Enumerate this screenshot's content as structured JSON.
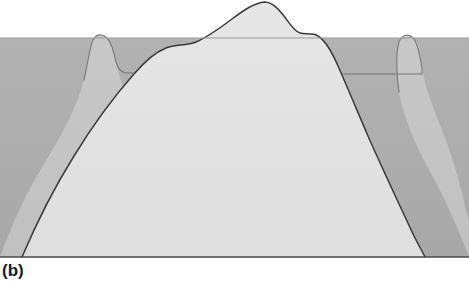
{
  "figure": {
    "panel_label": "(b)",
    "caption_text": "",
    "title": "",
    "kind": "geologic-block-cross-section"
  },
  "colors": {
    "background": "#ffffff",
    "block_base": "#adadad",
    "intermediate_layer": "#c4c4c4",
    "core_mountain": "#e3e3e3",
    "outline": "#3a3a3a",
    "soft_edge": "#8e8e8e",
    "label_text": "#1c1c1c"
  },
  "geometry": {
    "canvas": {
      "width": 469,
      "height": 283
    },
    "block": {
      "left": 0,
      "top": 38,
      "right": 469,
      "bottom": 257
    },
    "summit": {
      "x": 265,
      "y": 2
    },
    "left_bump_apex": {
      "x": 98,
      "y": 35
    },
    "right_bump_apex": {
      "x": 408,
      "y": 36
    }
  },
  "layers": [
    {
      "name": "block-base",
      "role": "surrounding-rock-mass",
      "fill": "#adadad",
      "path": "M 0 38 L 469 38 L 469 257 L 0 257 Z"
    },
    {
      "name": "intermediate-layer-left",
      "role": "eroded-flank-left",
      "fill": "#c4c4c4",
      "path": "M 0 257 C 10 230 24 196 44 164 C 62 134 76 110 84 80 C 88 62 90 46 93 40 C 96 34 102 33 107 38 C 112 43 114 52 116 62 C 119 76 124 92 134 112 C 146 136 160 164 172 190 C 182 212 190 236 196 257 Z"
    },
    {
      "name": "intermediate-layer-right",
      "role": "eroded-flank-right",
      "fill": "#c4c4c4",
      "path": "M 469 257 C 458 228 444 196 428 168 C 414 142 404 118 399 92 C 396 72 396 52 399 42 C 402 34 409 33 414 39 C 418 45 420 56 422 68 C 425 86 432 106 442 130 C 452 154 462 190 469 222 Z"
    },
    {
      "name": "core-mountain",
      "role": "central-massif",
      "fill": "#e3e3e3",
      "path": "M 22 257 C 36 224 54 188 74 156 C 96 120 118 92 134 74 C 146 60 156 52 166 48 C 176 44 186 46 196 42 C 208 37 220 28 232 19 C 244 10 254 3 265 2 C 272 2 278 8 284 16 C 290 24 294 31 300 33 C 306 35 312 32 318 36 C 326 41 332 52 338 66 C 346 84 356 108 368 136 C 382 168 400 206 414 236 C 418 244 422 251 425 257 Z"
    }
  ],
  "outlines": [
    {
      "name": "core-mountain-outline",
      "stroke": "#3a3a3a",
      "path": "M 22 257 C 36 224 54 188 74 156 C 96 120 118 92 134 74 C 146 60 156 52 166 48 C 176 44 186 46 196 42 C 208 37 220 28 232 19 C 244 10 254 3 265 2 C 272 2 278 8 284 16 C 290 24 294 31 300 33 C 306 35 312 32 318 36 C 326 41 332 52 338 66 C 346 84 356 108 368 136 C 382 168 400 206 414 236 C 418 244 422 251 425 257"
    },
    {
      "name": "left-bump-outline",
      "stroke": "#6b6b6b",
      "path": "M 84 80 C 88 62 90 46 93 40 C 96 34 102 33 107 38 C 112 43 114 52 116 62 C 118 68 120 72 126 73 L 170 73"
    },
    {
      "name": "right-bump-outline",
      "stroke": "#6b6b6b",
      "path": "M 399 92 C 396 72 396 52 399 42 C 402 34 409 33 414 39 C 418 45 420 56 422 68 L 422 74 L 340 74"
    },
    {
      "name": "block-top-edge",
      "stroke": "#9a9a9a",
      "path": "M 0 38 L 469 38"
    },
    {
      "name": "block-bottom-edge",
      "stroke": "#4a4a4a",
      "path": "M 0 257 L 469 257"
    }
  ]
}
